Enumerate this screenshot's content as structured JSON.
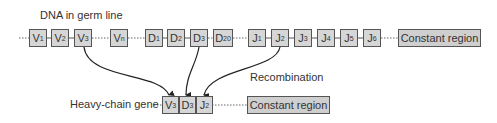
{
  "title": "DNA in germ line",
  "germline": {
    "v_segments": [
      {
        "base": "V",
        "sub": "1",
        "x": 29,
        "w": 18
      },
      {
        "base": "V",
        "sub": "2",
        "x": 51,
        "w": 18
      },
      {
        "base": "V",
        "sub": "3",
        "x": 74,
        "w": 18
      },
      {
        "base": "V",
        "sub": "n",
        "x": 110,
        "w": 18
      }
    ],
    "d_segments": [
      {
        "base": "D",
        "sub": "1",
        "x": 145,
        "w": 18
      },
      {
        "base": "D",
        "sub": "2",
        "x": 167,
        "w": 18
      },
      {
        "base": "D",
        "sub": "3",
        "x": 190,
        "w": 18
      },
      {
        "base": "D",
        "sub": "20",
        "x": 213,
        "w": 20
      }
    ],
    "j_segments": [
      {
        "base": "J",
        "sub": "1",
        "x": 248,
        "w": 18
      },
      {
        "base": "J",
        "sub": "2",
        "x": 271,
        "w": 18
      },
      {
        "base": "J",
        "sub": "3",
        "x": 294,
        "w": 18
      },
      {
        "base": "J",
        "sub": "4",
        "x": 317,
        "w": 18
      },
      {
        "base": "J",
        "sub": "5",
        "x": 340,
        "w": 18
      },
      {
        "base": "J",
        "sub": "6",
        "x": 363,
        "w": 18
      }
    ],
    "constant_label": "Constant region"
  },
  "recombination_label": "Recombination",
  "heavy_chain": {
    "label": "Heavy-chain gene",
    "segments": [
      {
        "base": "V",
        "sub": "3"
      },
      {
        "base": "D",
        "sub": "3"
      },
      {
        "base": "J",
        "sub": "2"
      }
    ],
    "constant_label": "Constant region"
  },
  "colors": {
    "segment_fill": "#d6d6d6",
    "border": "#555555",
    "text": "#333333"
  }
}
